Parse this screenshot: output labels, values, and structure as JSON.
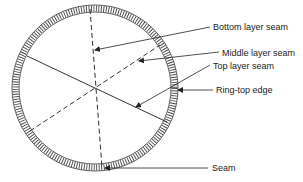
{
  "diagram": {
    "type": "ring seam layout",
    "labels": {
      "bottom_layer_seam": "Bottom layer seam",
      "middle_layer_seam": "Middle layer seam",
      "top_layer_seam": "Top layer seam",
      "ring_top_edge": "Ring-top edge",
      "seam": "Seam"
    },
    "colors": {
      "stroke": "#333333",
      "text": "#1a1a1a",
      "background": "#ffffff"
    }
  }
}
